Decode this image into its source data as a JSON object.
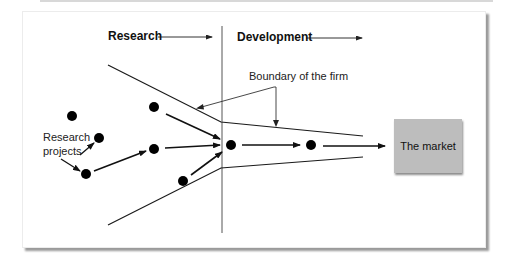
{
  "diagram": {
    "phases": {
      "research_label": "Research",
      "development_label": "Development"
    },
    "annotations": {
      "boundary_label": "Boundary of the firm",
      "projects_label_line1": "Research",
      "projects_label_line2": "projects"
    },
    "market_label": "The market",
    "nodes": [
      {
        "id": "p1",
        "x": 72,
        "y": 116
      },
      {
        "id": "p2",
        "x": 99,
        "y": 138
      },
      {
        "id": "p3",
        "x": 86,
        "y": 174
      },
      {
        "id": "p4",
        "x": 154,
        "y": 107
      },
      {
        "id": "p5",
        "x": 154,
        "y": 149
      },
      {
        "id": "p6",
        "x": 183,
        "y": 181
      },
      {
        "id": "d1",
        "x": 231,
        "y": 145
      },
      {
        "id": "d2",
        "x": 311,
        "y": 145
      }
    ],
    "colors": {
      "line": "#1a1a1a",
      "node": "#000000",
      "market_fill": "#bdbdbd",
      "divider": "#555555"
    }
  }
}
